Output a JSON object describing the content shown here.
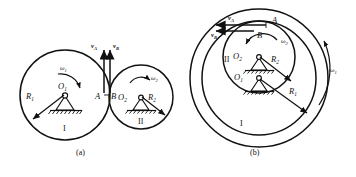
{
  "figure": {
    "type": "engineering-mechanics-diagram",
    "title_visible": false,
    "background_color": "#ffffff",
    "line_color": "#111111",
    "panels": [
      {
        "id": "a",
        "caption": "(a)",
        "description": "External contact of two wheels rotating about fixed pin supports",
        "bodies": [
          {
            "name": "wheel-I",
            "roman_label": "I",
            "center_label": "O",
            "center_sub": "1",
            "radius_label": "R",
            "radius_sub": "1",
            "omega_label": "ω",
            "omega_sub": "1",
            "omega_sense": "clockwise",
            "support": "pin-on-ground"
          },
          {
            "name": "wheel-II",
            "roman_label": "II",
            "center_label": "O",
            "center_sub": "2",
            "radius_label": "R",
            "radius_sub": "2",
            "omega_label": "ω",
            "omega_sub": "2",
            "omega_sense": "clockwise",
            "support": "pin-on-ground"
          }
        ],
        "contact_points": [
          {
            "label": "A",
            "belongs_to": "wheel-I"
          },
          {
            "label": "B",
            "belongs_to": "wheel-II"
          }
        ],
        "velocity_vectors": [
          {
            "label": "v",
            "sub": "A",
            "direction": "up",
            "at_point": "A"
          },
          {
            "label": "v",
            "sub": "B",
            "direction": "up",
            "at_point": "B"
          }
        ]
      },
      {
        "id": "b",
        "caption": "(b)",
        "description": "Internal contact: small wheel II inside ring I, concentric rings",
        "bodies": [
          {
            "name": "ring-I",
            "roman_label": "I",
            "center_label": "O",
            "center_sub": "1",
            "radius_label": "R",
            "radius_sub": "1",
            "omega_label": "ω",
            "omega_sub": "1",
            "omega_sense": "counterclockwise",
            "support": "pin-on-ground"
          },
          {
            "name": "wheel-II",
            "roman_label": "II",
            "center_label": "O",
            "center_sub": "2",
            "radius_label": "R",
            "radius_sub": "2",
            "omega_label": "ω",
            "omega_sub": "2",
            "omega_sense": "counterclockwise",
            "support": "pin-on-ground"
          }
        ],
        "contact_points": [
          {
            "label": "A",
            "belongs_to": "ring-I"
          },
          {
            "label": "B",
            "belongs_to": "wheel-II"
          }
        ],
        "velocity_vectors": [
          {
            "label": "v",
            "sub": "A",
            "direction": "left",
            "at_point": "A"
          },
          {
            "label": "v",
            "sub": "B",
            "direction": "left",
            "at_point": "B"
          }
        ]
      }
    ]
  }
}
